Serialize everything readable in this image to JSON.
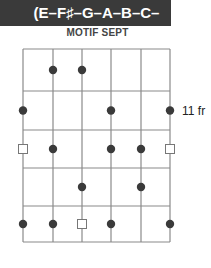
{
  "header": {
    "notes_label": "(E–F♯–G–A–B–C–D♯)",
    "background": "#3a3a3a",
    "text_color": "#ffffff"
  },
  "diagram": {
    "title": "MOTIF SEPT",
    "fret_label": "11 fr",
    "strings": 6,
    "frets": 5,
    "string_x": [
      23,
      53,
      82,
      111,
      141,
      170
    ],
    "fret_y": [
      49,
      91,
      130,
      168,
      206,
      242
    ],
    "line_color": "#8a8a8a",
    "dot_color": "#3a3a3a",
    "markers": [
      {
        "fret": 1,
        "string": 2,
        "type": "dot"
      },
      {
        "fret": 1,
        "string": 3,
        "type": "dot"
      },
      {
        "fret": 2,
        "string": 1,
        "type": "dot"
      },
      {
        "fret": 2,
        "string": 4,
        "type": "dot"
      },
      {
        "fret": 2,
        "string": 6,
        "type": "dot"
      },
      {
        "fret": 3,
        "string": 1,
        "type": "square"
      },
      {
        "fret": 3,
        "string": 2,
        "type": "dot"
      },
      {
        "fret": 3,
        "string": 4,
        "type": "dot"
      },
      {
        "fret": 3,
        "string": 5,
        "type": "dot"
      },
      {
        "fret": 3,
        "string": 6,
        "type": "square"
      },
      {
        "fret": 4,
        "string": 3,
        "type": "dot"
      },
      {
        "fret": 4,
        "string": 5,
        "type": "dot"
      },
      {
        "fret": 5,
        "string": 1,
        "type": "dot"
      },
      {
        "fret": 5,
        "string": 2,
        "type": "dot"
      },
      {
        "fret": 5,
        "string": 3,
        "type": "square"
      },
      {
        "fret": 5,
        "string": 4,
        "type": "dot"
      },
      {
        "fret": 5,
        "string": 6,
        "type": "dot"
      }
    ]
  }
}
